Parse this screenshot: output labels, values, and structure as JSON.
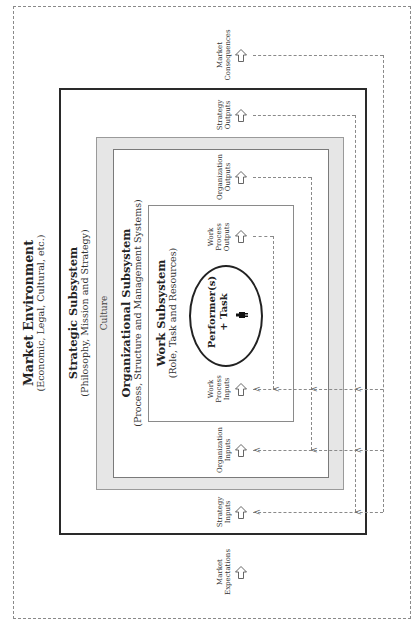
{
  "diagram": {
    "orientation": "rotated -90deg (text reads bottom-to-top)",
    "market_environment": {
      "title": "Market Environment",
      "subtitle": "(Economic, Legal, Cultural, etc.)"
    },
    "strategic_subsystem": {
      "title": "Strategic Subsystem",
      "subtitle": "(Philosophy, Mission and Strategy)"
    },
    "culture": {
      "label": "Culture"
    },
    "organizational_subsystem": {
      "title": "Organizational Subsystem",
      "subtitle": "(Process, Structure and Management Systems)"
    },
    "work_subsystem": {
      "title": "Work Subsystem",
      "subtitle": "(Role, Task and Resources)"
    },
    "performer": {
      "line1": "Performer(s)",
      "line2": "+ Task",
      "icon": "person-icon"
    },
    "outputs": [
      {
        "line1": "Market",
        "line2": "Consequences",
        "line3": ""
      },
      {
        "line1": "Strategy",
        "line2": "Outputs",
        "line3": ""
      },
      {
        "line1": "Organization",
        "line2": "Outputs",
        "line3": ""
      },
      {
        "line1": "Work",
        "line2": "Process",
        "line3": "Outputs"
      }
    ],
    "inputs": [
      {
        "line1": "Work",
        "line2": "Process",
        "line3": "Inputs"
      },
      {
        "line1": "Organization",
        "line2": "Inputs",
        "line3": ""
      },
      {
        "line1": "Strategy",
        "line2": "Inputs",
        "line3": ""
      },
      {
        "line1": "Market",
        "line2": "Expectations",
        "line3": ""
      }
    ],
    "feedback_marker": "<",
    "colors": {
      "border_dark": "#2a2a2a",
      "culture_fill": "#e6e6e6",
      "dashed": "#8a8a8a"
    }
  }
}
